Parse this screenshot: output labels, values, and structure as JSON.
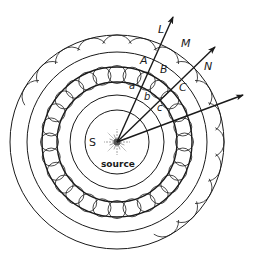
{
  "diagram": {
    "source": {
      "label_letter": "S",
      "label_text": "source",
      "cx": 117,
      "cy": 142
    },
    "colors": {
      "stroke": "#1a1a1a",
      "background": "#ffffff",
      "rays": "#8a8a8a"
    },
    "wavefronts": {
      "radii": [
        32,
        47,
        60,
        75,
        90,
        107
      ],
      "wavelet_band": {
        "inner_radius": 60,
        "outer_radius": 75,
        "wavelet_count": 28,
        "wavelet_radius": 9
      }
    },
    "arrows": [
      {
        "name": "ray-L",
        "tip": [
          173,
          17
        ]
      },
      {
        "name": "ray-N",
        "tip": [
          215,
          47
        ]
      },
      {
        "name": "ray-third",
        "tip": [
          243,
          95
        ]
      }
    ],
    "labels": [
      {
        "id": "L",
        "text": "L",
        "x": 158,
        "y": 33,
        "size": "big"
      },
      {
        "id": "M",
        "text": "M",
        "x": 181,
        "y": 47,
        "size": "big"
      },
      {
        "id": "N",
        "text": "N",
        "x": 204,
        "y": 70,
        "size": "big"
      },
      {
        "id": "A",
        "text": "A",
        "x": 140,
        "y": 64,
        "size": "big"
      },
      {
        "id": "B",
        "text": "B",
        "x": 160,
        "y": 73,
        "size": "big"
      },
      {
        "id": "C",
        "text": "C",
        "x": 179,
        "y": 91,
        "size": "big"
      },
      {
        "id": "a",
        "text": "a",
        "x": 129,
        "y": 89,
        "size": "small"
      },
      {
        "id": "b",
        "text": "b",
        "x": 144,
        "y": 100,
        "size": "small"
      },
      {
        "id": "c",
        "text": "c",
        "x": 157,
        "y": 111,
        "size": "small"
      },
      {
        "id": "S",
        "text": "S",
        "x": 89,
        "y": 146,
        "size": "big"
      },
      {
        "id": "source",
        "text": "source",
        "x": 101,
        "y": 167,
        "size": "src"
      }
    ]
  }
}
